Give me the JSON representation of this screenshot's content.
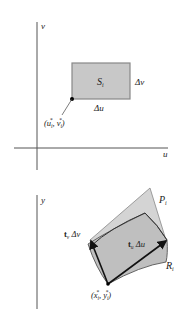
{
  "top_panel": {
    "x_axis_label": "u",
    "y_axis_label": "v",
    "region_label": "S",
    "region_sub": "i",
    "du_label": "Δu",
    "dv_label": "Δv",
    "point_label_open": "(u",
    "point_label_mid": ", v",
    "point_label_close": ")",
    "point_sub": "i",
    "point_sup": "*"
  },
  "bottom_panel": {
    "y_axis_label": "y",
    "parallelogram_label": "P",
    "parallelogram_sub": "i",
    "region_label": "R",
    "region_sub": "i",
    "vector_u_bold": "t",
    "vector_u_sub": "u",
    "vector_u_rest": " Δu",
    "vector_v_bold": "t",
    "vector_v_sub": "v",
    "vector_v_rest": " Δv",
    "point_label_open": "(x",
    "point_label_mid": ", y",
    "point_label_close": ")",
    "point_sub": "i",
    "point_sup": "*"
  },
  "colors": {
    "axis": "#555555",
    "fill": "#c8c8c8",
    "outline": "#777777",
    "vector": "#111111"
  }
}
